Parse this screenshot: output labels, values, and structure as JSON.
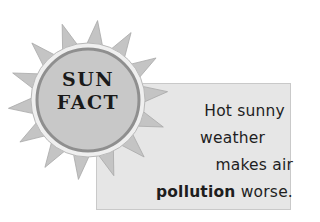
{
  "badge": {
    "line1": "SUN",
    "line2": "FACT"
  },
  "fact": {
    "line1": "Hot sunny",
    "line2": "weather",
    "line3": "makes air",
    "line4_bold": "pollution",
    "line4_rest": " worse."
  },
  "colors": {
    "sun_body": "#c8c8c8",
    "sun_ring": "#8f8f8f",
    "sun_rim": "#ececec",
    "rays": "#c4c4c4",
    "box_bg": "#e6e6e6",
    "text": "#1e1e1e"
  }
}
